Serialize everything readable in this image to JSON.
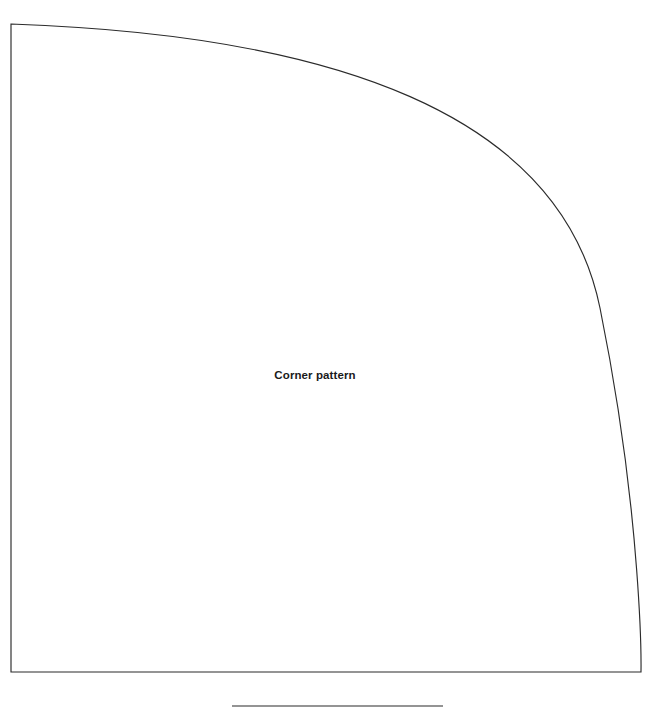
{
  "document": {
    "title": "Corner pattern",
    "background_color": "#ffffff"
  },
  "pattern": {
    "label": "Corner pattern",
    "label_weight": "bold",
    "label_color": "#1a1a1a",
    "line_color": "#2b2b2b",
    "line_width_px": 1.15,
    "shape_type": "quarter-round corner template",
    "outline": {
      "top_left_corner": [
        11,
        24
      ],
      "bottom_left_corner": [
        11,
        672
      ],
      "bottom_right_corner": [
        641,
        672
      ],
      "arc_start": [
        11,
        24
      ],
      "arc_end": [
        641,
        672
      ],
      "arc_description": "convex curve sweeping from the top-left corner down to the bottom-right corner"
    },
    "baseline_rule": {
      "x_start": 232,
      "x_end": 443,
      "y": 706,
      "color": "#2b2b2b"
    }
  }
}
